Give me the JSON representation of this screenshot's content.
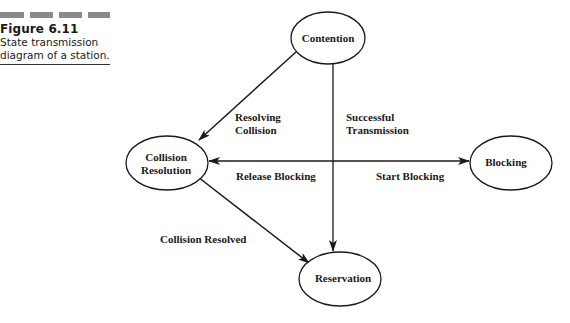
{
  "figure": {
    "number": "Figure 6.11",
    "caption_line1": "State transmission",
    "caption_line2": "diagram of a station."
  },
  "colors": {
    "ink": "#1a1a1a",
    "dash_gray": "#8a8a8a",
    "background": "#ffffff"
  },
  "nodes": {
    "contention": {
      "label": "Contention"
    },
    "collision_resolution": {
      "label_line1": "Collision",
      "label_line2": "Resolution"
    },
    "blocking": {
      "label": "Blocking"
    },
    "reservation": {
      "label": "Reservation"
    }
  },
  "edges": {
    "resolving_collision": {
      "label_line1": "Resolving",
      "label_line2": "Collision",
      "from": "Contention",
      "to": "Collision Resolution"
    },
    "successful_transmission": {
      "label_line1": "Successful",
      "label_line2": "Transmission",
      "from": "Contention",
      "to": "Reservation"
    },
    "release_blocking": {
      "label": "Release Blocking",
      "from": "Blocking",
      "to": "Collision Resolution"
    },
    "start_blocking": {
      "label": "Start Blocking",
      "from": "Collision Resolution",
      "to": "Blocking"
    },
    "collision_resolved": {
      "label": "Collision Resolved",
      "from": "Collision Resolution",
      "to": "Reservation"
    }
  }
}
